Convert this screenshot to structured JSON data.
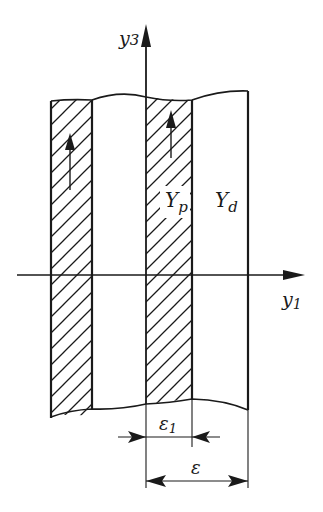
{
  "diagram": {
    "axes": {
      "vertical": {
        "label": "y",
        "subscript": "3"
      },
      "horizontal": {
        "label": "y",
        "subscript": "1"
      }
    },
    "regions": {
      "piezo": {
        "label": "Y",
        "subscript": "p"
      },
      "dielectric": {
        "label": "Y",
        "subscript": "d"
      }
    },
    "dimensions": {
      "inner": {
        "label": "ε",
        "subscript": "1"
      },
      "outer": {
        "label": "ε"
      }
    },
    "colors": {
      "ink": "#1a1a1a",
      "background": "#ffffff"
    }
  }
}
